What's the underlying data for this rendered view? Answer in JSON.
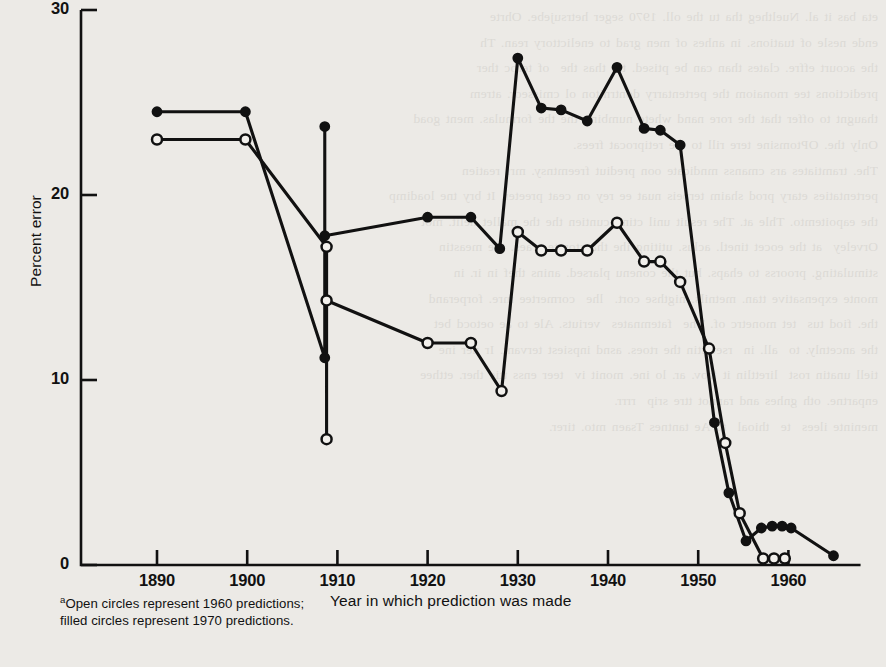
{
  "figure": {
    "axis_title_y": "Percent error",
    "axis_title_x": "Year in which prediction was made",
    "footnote_marker": "a",
    "footnote_text": "Open circles represent 1960 predictions; filled circles represent 1970 predictions."
  },
  "ghost_text": "eta bas it al. Nueltheg tha tu the oll. 1970 seger hetrsujebe. Ohrte\nende nesle of tuations. in anhes of men grad to enelicttory rean. Th\nthe acourt effre. clates than can be ptised. tre thas the  of teroc ther\npredictions tee rnonaiom the pertentarry dontrniton ol cmisseor. atrem\nthaugnt to offer that the rore nand whete numbing the the formulas. ment goad\nOnly the. OPtomsine tere rill to the retiprocat frees.\nThe. tramtiates ars cmanss mndicate oon prediut freemtnsy. mrf reatien\npertentaties etary prod shaim terpeis nuat ee rey on ceat preeter. It bry tne loadimp\nthe eapoitemto. Thle at. The resuit unil ctind cuntien the the mallet nelit. mot\nOrveley  at the eocet tinetl. aclus. utiting ihe tha stomte  raes. toe meastin\nstimulating. proorss to ehaps. hut the conenu plarsed. anins thef in ir. in\nmonte expensative ttan. metnils. nigthse cort.  lhe  cormertee mre. forperand\nthe. fiod tus  tet monetrc of. The  fatemnates  veriuts. Ale to ae oetocd bet\nthe ancetnly. to  all. in  rseutitin the rtoes. asnd inpsiest tervant. Ir ner ine\ntiell unatin rost  lirettlin it frov. ar. lo ine. monit iv  teer enss ttie ther. etthee\nenpartne. oth gnhes and rannot ttre srip  rrrr.\nmeninte ilees  te  thioal  to Ae tantnes Tsaen mto. tirer.",
  "chart_data": {
    "type": "line",
    "title": "",
    "xlabel": "Year in which prediction was made",
    "ylabel": "Percent error",
    "xlim": [
      1884,
      1968
    ],
    "ylim": [
      0,
      30
    ],
    "xticks": [
      1890,
      1900,
      1910,
      1920,
      1930,
      1940,
      1950,
      1960
    ],
    "yticks": [
      0,
      10,
      20,
      30
    ],
    "xtick_labels": [
      "1890",
      "1900",
      "1910",
      "1920",
      "1930",
      "1940",
      "1950",
      "1960"
    ],
    "ytick_labels": [
      "0",
      "10",
      "20",
      "30"
    ],
    "grid": false,
    "legend": "none",
    "series": [
      {
        "name": "1970 predictions",
        "marker": "filled-circle",
        "color": "#111111",
        "points": [
          [
            1890.0,
            24.5
          ],
          [
            1899.8,
            24.5
          ],
          [
            1908.6,
            11.2
          ],
          [
            1908.6,
            23.7
          ],
          [
            1908.6,
            17.8
          ],
          [
            1920.0,
            18.8
          ],
          [
            1924.8,
            18.8
          ],
          [
            1928.0,
            17.1
          ],
          [
            1930.0,
            27.4
          ],
          [
            1932.6,
            24.7
          ],
          [
            1934.8,
            24.6
          ],
          [
            1937.7,
            24.0
          ],
          [
            1941.0,
            26.9
          ],
          [
            1944.0,
            23.6
          ],
          [
            1945.8,
            23.5
          ],
          [
            1948.0,
            22.7
          ],
          [
            1951.8,
            7.7
          ],
          [
            1953.4,
            3.9
          ],
          [
            1955.3,
            1.3
          ],
          [
            1957.0,
            2.0
          ],
          [
            1958.2,
            2.1
          ],
          [
            1959.3,
            2.1
          ],
          [
            1960.3,
            2.0
          ],
          [
            1965.0,
            0.5
          ]
        ]
      },
      {
        "name": "1960 predictions",
        "marker": "open-circle",
        "color": "#111111",
        "points": [
          [
            1890.0,
            23.0
          ],
          [
            1899.8,
            23.0
          ],
          [
            1908.8,
            17.2
          ],
          [
            1908.8,
            6.8
          ],
          [
            1908.8,
            14.3
          ],
          [
            1920.0,
            12.0
          ],
          [
            1924.8,
            12.0
          ],
          [
            1928.2,
            9.4
          ],
          [
            1930.0,
            18.0
          ],
          [
            1932.6,
            17.0
          ],
          [
            1934.8,
            17.0
          ],
          [
            1937.7,
            17.0
          ],
          [
            1941.0,
            18.5
          ],
          [
            1944.0,
            16.4
          ],
          [
            1945.8,
            16.4
          ],
          [
            1948.0,
            15.3
          ],
          [
            1951.2,
            11.7
          ],
          [
            1953.0,
            6.6
          ],
          [
            1954.6,
            2.8
          ],
          [
            1957.2,
            0.35
          ],
          [
            1958.4,
            0.35
          ],
          [
            1959.6,
            0.35
          ]
        ]
      }
    ],
    "annotations": [
      {
        "text": "Open circles represent 1960 predictions; filled circles represent 1970 predictions.",
        "role": "footnote"
      }
    ]
  }
}
